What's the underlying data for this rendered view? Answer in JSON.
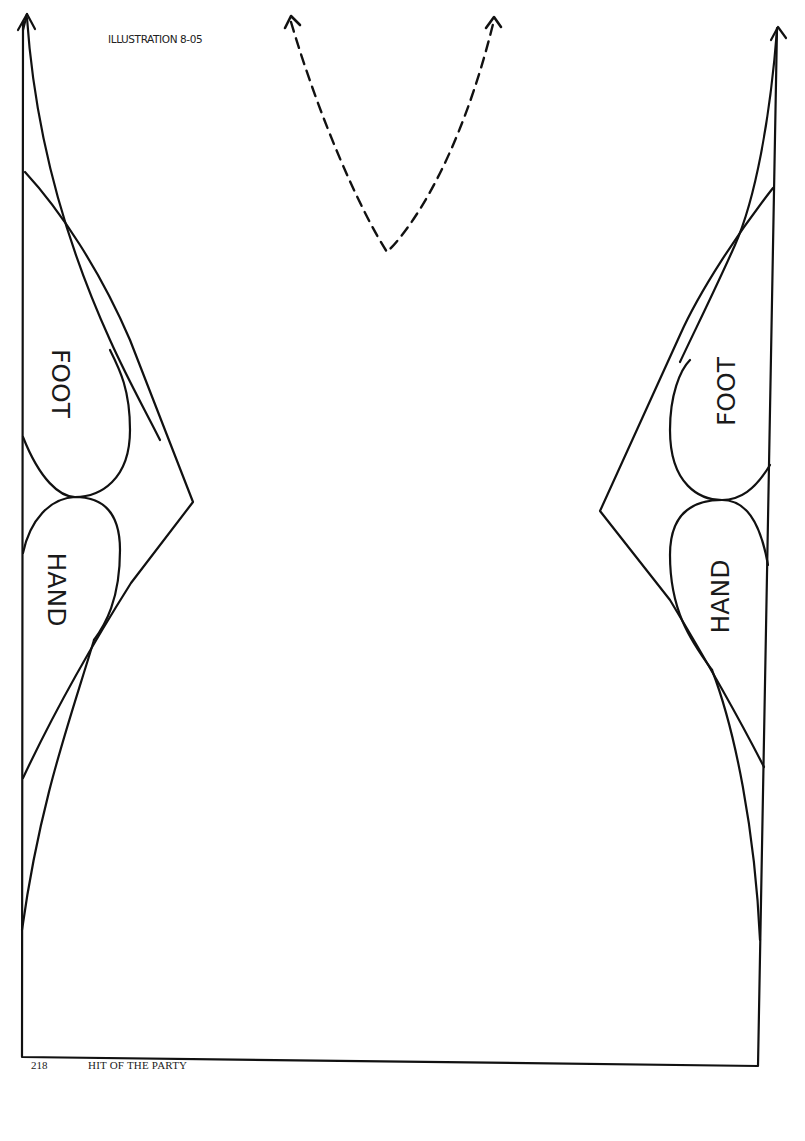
{
  "illustration": {
    "title": "ILLUSTRATION 8-05",
    "stroke_color": "#111111",
    "background": "#ffffff"
  },
  "pattern": {
    "left_side": {
      "labels": {
        "upper": "FOOT",
        "lower": "HAND"
      }
    },
    "right_side": {
      "labels": {
        "upper": "FOOT",
        "lower": "HAND"
      }
    },
    "neckline": {
      "style": "dashed",
      "arrows": 2
    },
    "edge_arrows": 2
  },
  "footer": {
    "page_number": "218",
    "book_title": "HIT OF THE PARTY"
  }
}
